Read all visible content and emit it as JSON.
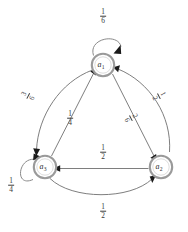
{
  "figure": {
    "type": "state-transition-diagram",
    "background_color": "#ffffff",
    "node_stroke_color": "#9a9a9a",
    "edge_color": "#6f6f6f",
    "arrow_color": "#1a1a1a",
    "label_color": "#3a3a3a"
  },
  "nodes": [
    {
      "id": "a1",
      "name": "a",
      "subscript": "1",
      "label": "a₁",
      "cx": 103,
      "cy": 65,
      "r": 12
    },
    {
      "id": "a3",
      "name": "a",
      "subscript": "3",
      "label": "a₃",
      "cx": 45,
      "cy": 167,
      "r": 12
    },
    {
      "id": "a2",
      "name": "a",
      "subscript": "2",
      "label": "a₂",
      "cx": 161,
      "cy": 167,
      "r": 12
    }
  ],
  "edges": [
    {
      "id": "a1-self",
      "from": "a1",
      "to": "a1",
      "kind": "self-loop",
      "label": {
        "numerator": "1",
        "denominator": "6",
        "text": "1/6"
      },
      "label_x": 103,
      "label_y": 16,
      "rotation": 0
    },
    {
      "id": "a3-self",
      "from": "a3",
      "to": "a3",
      "kind": "self-loop",
      "label": {
        "numerator": "1",
        "denominator": "4",
        "text": "1/4"
      },
      "label_x": 11,
      "label_y": 185,
      "rotation": 0
    },
    {
      "id": "a1-to-a3-outer",
      "from": "a1",
      "to": "a3",
      "kind": "outer-arc",
      "label": {
        "numerator": "3",
        "denominator": "6",
        "text": "3/6"
      },
      "label_x": 28,
      "label_y": 96,
      "rotation": -62
    },
    {
      "id": "a2-to-a1-outer",
      "from": "a2",
      "to": "a1",
      "kind": "outer-arc",
      "label": {
        "numerator": "1",
        "denominator": "2",
        "text": "1/2"
      },
      "label_x": 159,
      "label_y": 96,
      "rotation": 62
    },
    {
      "id": "a3-to-a1-inner",
      "from": "a3",
      "to": "a1",
      "kind": "chord",
      "label": {
        "numerator": "1",
        "denominator": "4",
        "text": "1/4"
      },
      "label_x": 70,
      "label_y": 118,
      "rotation": 0
    },
    {
      "id": "a1-to-a2-inner",
      "from": "a1",
      "to": "a2",
      "kind": "chord",
      "label": {
        "numerator": "2",
        "denominator": "6",
        "text": "2/6"
      },
      "label_x": 131,
      "label_y": 118,
      "rotation": 62
    },
    {
      "id": "a2-to-a3-middle",
      "from": "a2",
      "to": "a3",
      "kind": "chord",
      "label": {
        "numerator": "1",
        "denominator": "2",
        "text": "1/2"
      },
      "label_x": 103,
      "label_y": 152,
      "rotation": 0
    },
    {
      "id": "a3-to-a2-outer",
      "from": "a3",
      "to": "a2",
      "kind": "outer-arc",
      "label": {
        "numerator": "1",
        "denominator": "2",
        "text": "1/2"
      },
      "label_x": 103,
      "label_y": 211,
      "rotation": 0
    }
  ]
}
